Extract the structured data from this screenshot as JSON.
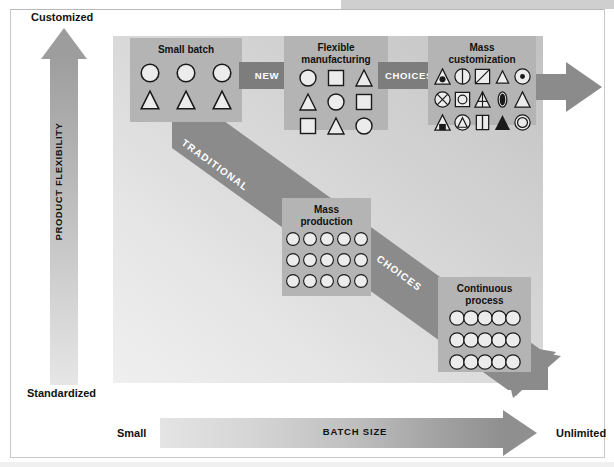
{
  "diagram": {
    "type": "manufacturing-strategy-matrix",
    "y_axis": {
      "name": "PRODUCT FLEXIBILITY",
      "top_label": "Customized",
      "bottom_label": "Standardized"
    },
    "x_axis": {
      "name": "BATCH SIZE",
      "left_label": "Small",
      "right_label": "Unlimited"
    },
    "boxes": [
      {
        "id": "small-batch",
        "title": "Small batch",
        "rows": [
          [
            "circle",
            "circle",
            "circle"
          ],
          [
            "triangle",
            "triangle",
            "triangle"
          ]
        ]
      },
      {
        "id": "flexible-manufacturing",
        "title": "Flexible\nmanufacturing",
        "title_line1": "Flexible",
        "title_line2": "manufacturing",
        "rows": [
          [
            "circle",
            "square",
            "triangle"
          ],
          [
            "triangle",
            "circle",
            "square"
          ],
          [
            "square",
            "triangle",
            "circle"
          ]
        ]
      },
      {
        "id": "mass-customization",
        "title": "Mass\ncustomization",
        "title_line1": "Mass",
        "title_line2": "customization",
        "rows": [
          [
            "triangle-dot",
            "circle-half",
            "square-diagonal",
            "triangle-small",
            "circle-dot"
          ],
          [
            "circle-x",
            "square-circle",
            "triangle-lines",
            "oval-filled",
            "triangle-plain"
          ],
          [
            "triangle-square",
            "circle-triangle",
            "rect-split",
            "triangle-filled",
            "circle-ring"
          ]
        ]
      },
      {
        "id": "mass-production",
        "title": "Mass\nproduction",
        "title_line1": "Mass",
        "title_line2": "production",
        "grid": {
          "cols": 5,
          "rows": 3,
          "shape": "circle"
        }
      },
      {
        "id": "continuous-process",
        "title": "Continuous\nprocess",
        "title_line1": "Continuous",
        "title_line2": "process",
        "grid": {
          "cols": 5,
          "rows": 3,
          "shape": "circle-overlapping"
        }
      }
    ],
    "connectors": [
      {
        "id": "new",
        "label": "NEW"
      },
      {
        "id": "choices-top",
        "label": "CHOICES"
      },
      {
        "id": "traditional",
        "label": "TRADITIONAL"
      },
      {
        "id": "choices-diagonal",
        "label": "CHOICES"
      }
    ],
    "colors": {
      "box_fill": "#b4b4b4",
      "connector_fill": "#7d7d7d",
      "arrow_dark": "#8b8b8b",
      "plot_bg_dark": "#c2c2c2",
      "plot_bg_light": "#efefef",
      "shape_fill": "#ececec",
      "shape_stroke": "#1a1a1a",
      "text": "#111111"
    }
  }
}
